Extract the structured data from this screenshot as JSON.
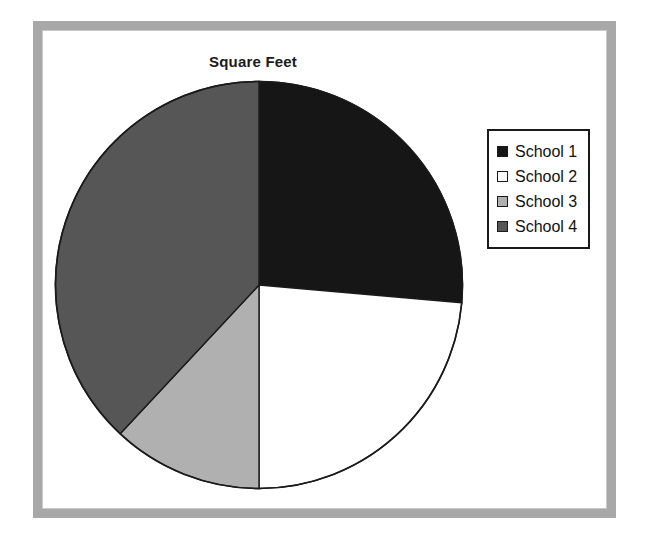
{
  "chart_data": {
    "type": "pie",
    "title": "Square Feet",
    "xlabel": "",
    "ylabel": "",
    "legend_position": "right",
    "grid": false,
    "start_angle_deg": 0,
    "direction": "clockwise",
    "categories": [
      "School 1",
      "School 2",
      "School 3",
      "School 4"
    ],
    "values": [
      26.4,
      23.6,
      12.0,
      38.0
    ],
    "units": "percent",
    "slices": [
      {
        "label": "School 1",
        "value": 26.4,
        "start_angle_deg": 0,
        "end_angle_deg": 95,
        "color": "#161616"
      },
      {
        "label": "School 2",
        "value": 23.6,
        "start_angle_deg": 95,
        "end_angle_deg": 180,
        "color": "#ffffff"
      },
      {
        "label": "School 3",
        "value": 12.0,
        "start_angle_deg": 180,
        "end_angle_deg": 223,
        "color": "#b0b0b0"
      },
      {
        "label": "School 4",
        "value": 38.0,
        "start_angle_deg": 223,
        "end_angle_deg": 360,
        "color": "#565656"
      }
    ]
  },
  "legend": {
    "items": [
      {
        "label": "School 1",
        "color": "#161616",
        "swatch": "legend-swatch-school-1"
      },
      {
        "label": "School 2",
        "color": "#ffffff",
        "swatch": "legend-swatch-school-2"
      },
      {
        "label": "School 3",
        "color": "#b0b0b0",
        "swatch": "legend-swatch-school-3"
      },
      {
        "label": "School 4",
        "color": "#565656",
        "swatch": "legend-swatch-school-4"
      }
    ]
  },
  "colors": {
    "frame": "#a8a8a8",
    "inner_frame": "#c9c9c9",
    "outline": "#1a1a1a",
    "background": "#ffffff",
    "title_text": "#1a1a1a"
  }
}
